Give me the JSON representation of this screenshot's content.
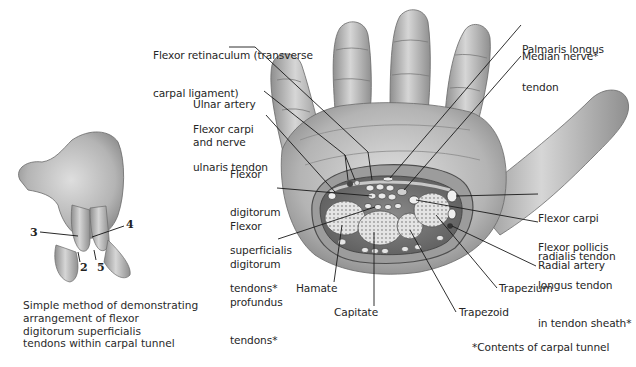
{
  "figure": {
    "main_view": "Palmar view of hand with cross-section through carpal tunnel",
    "labels": {
      "flexor_retinaculum": [
        "Flexor retinaculum (transverse",
        "carpal ligament)"
      ],
      "ulnar_artery_nerve": [
        "Ulnar artery",
        "and nerve"
      ],
      "fcu_tendon": [
        "Flexor carpi",
        "ulnaris tendon"
      ],
      "fds_tendons": [
        "Flexor",
        "digitorum",
        "superficialis",
        "tendons*"
      ],
      "fdp_tendons": [
        "Flexor",
        "digitorum",
        "profundus",
        "tendons*"
      ],
      "hamate": "Hamate",
      "capitate": "Capitate",
      "trapezoid": "Trapezoid",
      "trapezium": "Trapezium",
      "radial_artery": "Radial artery",
      "fpl_tendon": [
        "Flexor pollicis",
        "longus tendon",
        "in tendon sheath*"
      ],
      "fcr_tendon": [
        "Flexor carpi",
        "radialis tendon"
      ],
      "palmaris_longus": [
        "Palmaris longus",
        "tendon"
      ],
      "median_nerve": "Median nerve*"
    },
    "inset": {
      "finger_numbers": [
        "3",
        "4",
        "2",
        "5"
      ],
      "caption": [
        "Simple method of demonstrating",
        "arrangement of flexor",
        "digitorum superficialis",
        "tendons within carpal tunnel"
      ]
    },
    "footnote": "*Contents of carpal tunnel"
  },
  "colors": {
    "skin_light": "#dcdcdc",
    "skin_mid": "#a9a9a9",
    "skin_dark": "#6e6e6e",
    "bone": "#d8d8d8",
    "leader_line": "#1a1a1a",
    "text": "#262626"
  }
}
